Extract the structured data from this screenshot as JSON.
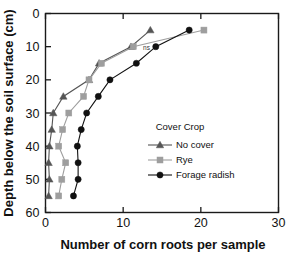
{
  "chart_data": {
    "type": "line",
    "title": "",
    "xlabel": "Number of corn roots per sample",
    "ylabel": "Depth below the soil surface (cm)",
    "xlim": [
      0,
      30
    ],
    "ylim": [
      60,
      0
    ],
    "y_inverted": true,
    "grid": false,
    "xticks": [
      0,
      10,
      20,
      30
    ],
    "yticks": [
      0,
      10,
      20,
      30,
      40,
      50,
      60
    ],
    "xtick_labels": [
      "0",
      "10",
      "20",
      "30"
    ],
    "ytick_labels": [
      "0",
      "10",
      "20",
      "30",
      "40",
      "50",
      "60"
    ],
    "legend_title": "Cover Crop",
    "legend_position": "center-right",
    "annotations": [
      {
        "text": "ns",
        "x": 13.0,
        "y": 11.0
      }
    ],
    "series": [
      {
        "name": "No cover",
        "marker": "triangle",
        "color": "#555555",
        "points": [
          {
            "x": 13.5,
            "y": 5
          },
          {
            "x": 11.0,
            "y": 10
          },
          {
            "x": 6.9,
            "y": 15
          },
          {
            "x": 5.6,
            "y": 20
          },
          {
            "x": 2.3,
            "y": 25
          },
          {
            "x": 1.0,
            "y": 30
          },
          {
            "x": 0.8,
            "y": 35
          },
          {
            "x": 0.5,
            "y": 40
          },
          {
            "x": 0.4,
            "y": 45
          },
          {
            "x": 0.5,
            "y": 50
          },
          {
            "x": 0.4,
            "y": 55
          }
        ]
      },
      {
        "name": "Rye",
        "marker": "square",
        "color": "#9e9e9e",
        "points": [
          {
            "x": 20.4,
            "y": 5
          },
          {
            "x": 11.3,
            "y": 10
          },
          {
            "x": 7.2,
            "y": 15
          },
          {
            "x": 5.6,
            "y": 20
          },
          {
            "x": 4.9,
            "y": 25
          },
          {
            "x": 3.0,
            "y": 30
          },
          {
            "x": 2.2,
            "y": 35
          },
          {
            "x": 1.7,
            "y": 40
          },
          {
            "x": 2.6,
            "y": 45
          },
          {
            "x": 2.1,
            "y": 50
          },
          {
            "x": 1.7,
            "y": 55
          }
        ]
      },
      {
        "name": "Forage radish",
        "marker": "circle",
        "color": "#111111",
        "points": [
          {
            "x": 18.5,
            "y": 5
          },
          {
            "x": 14.2,
            "y": 10
          },
          {
            "x": 11.7,
            "y": 15
          },
          {
            "x": 8.3,
            "y": 20
          },
          {
            "x": 6.8,
            "y": 25
          },
          {
            "x": 5.3,
            "y": 30
          },
          {
            "x": 4.6,
            "y": 35
          },
          {
            "x": 4.1,
            "y": 40
          },
          {
            "x": 4.2,
            "y": 45
          },
          {
            "x": 4.2,
            "y": 50
          },
          {
            "x": 3.6,
            "y": 55
          }
        ]
      }
    ]
  },
  "legend": {
    "title": "Cover Crop",
    "items": [
      {
        "label": "No cover"
      },
      {
        "label": "Rye"
      },
      {
        "label": "Forage radish"
      }
    ]
  },
  "axes": {
    "x_title": "Number of corn roots per sample",
    "y_title": "Depth below the soil surface (cm)"
  }
}
